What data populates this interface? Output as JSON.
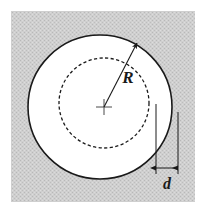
{
  "figure": {
    "background_color": "#ffffff",
    "panel": {
      "fill_color": "#c9c9c9",
      "x": 11,
      "y": 11,
      "width": 184,
      "height": 191
    },
    "stroke_color": "#1a1a1a",
    "disc_fill_color": "#ffffff"
  },
  "geometry": {
    "outer_circle": {
      "label": "outer-circle",
      "center_x": 100,
      "center_y": 107,
      "radius": 72,
      "style": "solid",
      "fill": "#ffffff"
    },
    "inner_circle": {
      "label": "inner-dashed-circle",
      "center_x": 104,
      "center_y": 103,
      "radius": 45,
      "style": "dashed",
      "fill": "none"
    },
    "center_mark": {
      "label": "center-cross",
      "x": 104,
      "y": 107,
      "arm_length": 8
    },
    "radius_arrow": {
      "label": "R",
      "from_x": 104,
      "from_y": 107,
      "to_x": 137,
      "to_y": 43
    },
    "dimension_d": {
      "label": "d",
      "left_x": 156,
      "right_x": 178,
      "arrow_y": 168,
      "left_line_top": 104,
      "right_line_top": 112
    }
  },
  "labels": {
    "radius": "R",
    "offset": "d"
  }
}
